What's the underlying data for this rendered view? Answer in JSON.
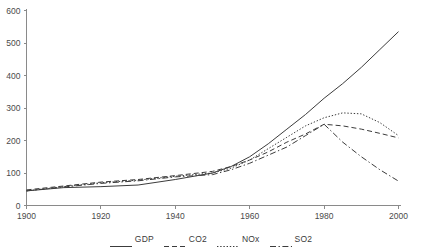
{
  "chart_data": {
    "type": "line",
    "title": "",
    "xlabel": "",
    "ylabel": "",
    "xlim": [
      1900,
      2000
    ],
    "ylim": [
      0,
      600
    ],
    "grid": false,
    "legend_position": "bottom",
    "x_ticks": [
      "1900",
      "1920",
      "1940",
      "1960",
      "1980",
      "2000"
    ],
    "x_tick_values": [
      1900,
      1920,
      1940,
      1960,
      1980,
      2000
    ],
    "y_ticks": [
      "0",
      "100",
      "200",
      "300",
      "400",
      "500",
      "600"
    ],
    "y_tick_values": [
      0,
      100,
      200,
      300,
      400,
      500,
      600
    ],
    "x": [
      1900,
      1910,
      1920,
      1930,
      1940,
      1950,
      1955,
      1960,
      1965,
      1970,
      1975,
      1980,
      1985,
      1990,
      1995,
      2000
    ],
    "series": [
      {
        "name": "GDP",
        "style": "solid",
        "values": [
          45,
          55,
          58,
          63,
          80,
          100,
          120,
          150,
          190,
          235,
          280,
          330,
          375,
          425,
          480,
          535
        ]
      },
      {
        "name": "CO2",
        "style": "dashed",
        "values": [
          48,
          60,
          72,
          80,
          92,
          105,
          120,
          140,
          165,
          195,
          220,
          250,
          245,
          235,
          222,
          208
        ]
      },
      {
        "name": "NOx",
        "style": "dotted",
        "values": [
          45,
          58,
          70,
          78,
          90,
          100,
          115,
          140,
          175,
          210,
          245,
          270,
          285,
          282,
          255,
          215
        ]
      },
      {
        "name": "SO2",
        "style": "dashdot",
        "values": [
          45,
          57,
          68,
          76,
          88,
          95,
          110,
          130,
          155,
          180,
          215,
          250,
          195,
          150,
          110,
          75
        ]
      }
    ]
  },
  "legend": {
    "entries": [
      {
        "label": "GDP",
        "style": "solid"
      },
      {
        "label": "CO2",
        "style": "dashed"
      },
      {
        "label": "NOx",
        "style": "dotted"
      },
      {
        "label": "SO2",
        "style": "dashdot"
      }
    ]
  },
  "colors": {
    "line": "#3c3c3c",
    "axis": "#8a8a8a",
    "text": "#4a4a4a",
    "background": "#ffffff"
  }
}
